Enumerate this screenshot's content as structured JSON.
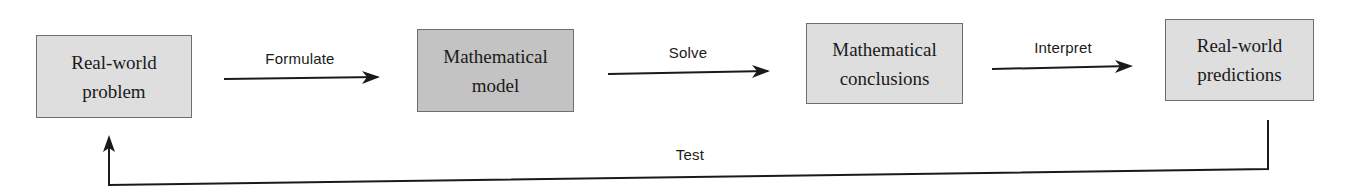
{
  "diagram": {
    "type": "flowchart",
    "nodes": [
      {
        "id": "real-world-problem",
        "line1": "Real-world",
        "line2": "problem",
        "fill": "#dedede"
      },
      {
        "id": "mathematical-model",
        "line1": "Mathematical",
        "line2": "model",
        "fill": "#c3c3c3"
      },
      {
        "id": "mathematical-conclusions",
        "line1": "Mathematical",
        "line2": "conclusions",
        "fill": "#dedede"
      },
      {
        "id": "real-world-predictions",
        "line1": "Real-world",
        "line2": "predictions",
        "fill": "#dedede"
      }
    ],
    "edges": [
      {
        "from": "real-world-problem",
        "to": "mathematical-model",
        "label": "Formulate"
      },
      {
        "from": "mathematical-model",
        "to": "mathematical-conclusions",
        "label": "Solve"
      },
      {
        "from": "mathematical-conclusions",
        "to": "real-world-predictions",
        "label": "Interpret"
      },
      {
        "from": "real-world-predictions",
        "to": "real-world-problem",
        "label": "Test"
      }
    ]
  }
}
